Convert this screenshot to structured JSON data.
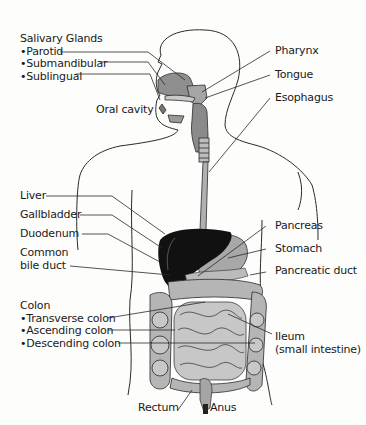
{
  "colors": {
    "outline": "#2a2a2a",
    "organ_gray": "#9a9a9a",
    "organ_light": "#c4c4c4",
    "liver": "#111111",
    "background": "#fdfdfc"
  },
  "labels_left": {
    "salivary": {
      "heading": "Salivary Glands",
      "items": [
        "•Parotid",
        "•Submandibular",
        "•Sublingual"
      ]
    },
    "oral_cavity": "Oral cavity",
    "liver": "Liver",
    "gallbladder": "Gallbladder",
    "duodenum": "Duodenum",
    "common_bile_duct": [
      "Common",
      "bile duct"
    ],
    "colon": {
      "heading": "Colon",
      "items": [
        "•Transverse colon",
        "•Ascending colon",
        "•Descending colon"
      ]
    },
    "rectum": "Rectum"
  },
  "labels_right": {
    "pharynx": "Pharynx",
    "tongue": "Tongue",
    "esophagus": "Esophagus",
    "pancreas": "Pancreas",
    "stomach": "Stomach",
    "pancreatic_duct": "Pancreatic duct",
    "ileum": [
      "Ileum",
      "(small intestine)"
    ],
    "anus": "Anus"
  }
}
